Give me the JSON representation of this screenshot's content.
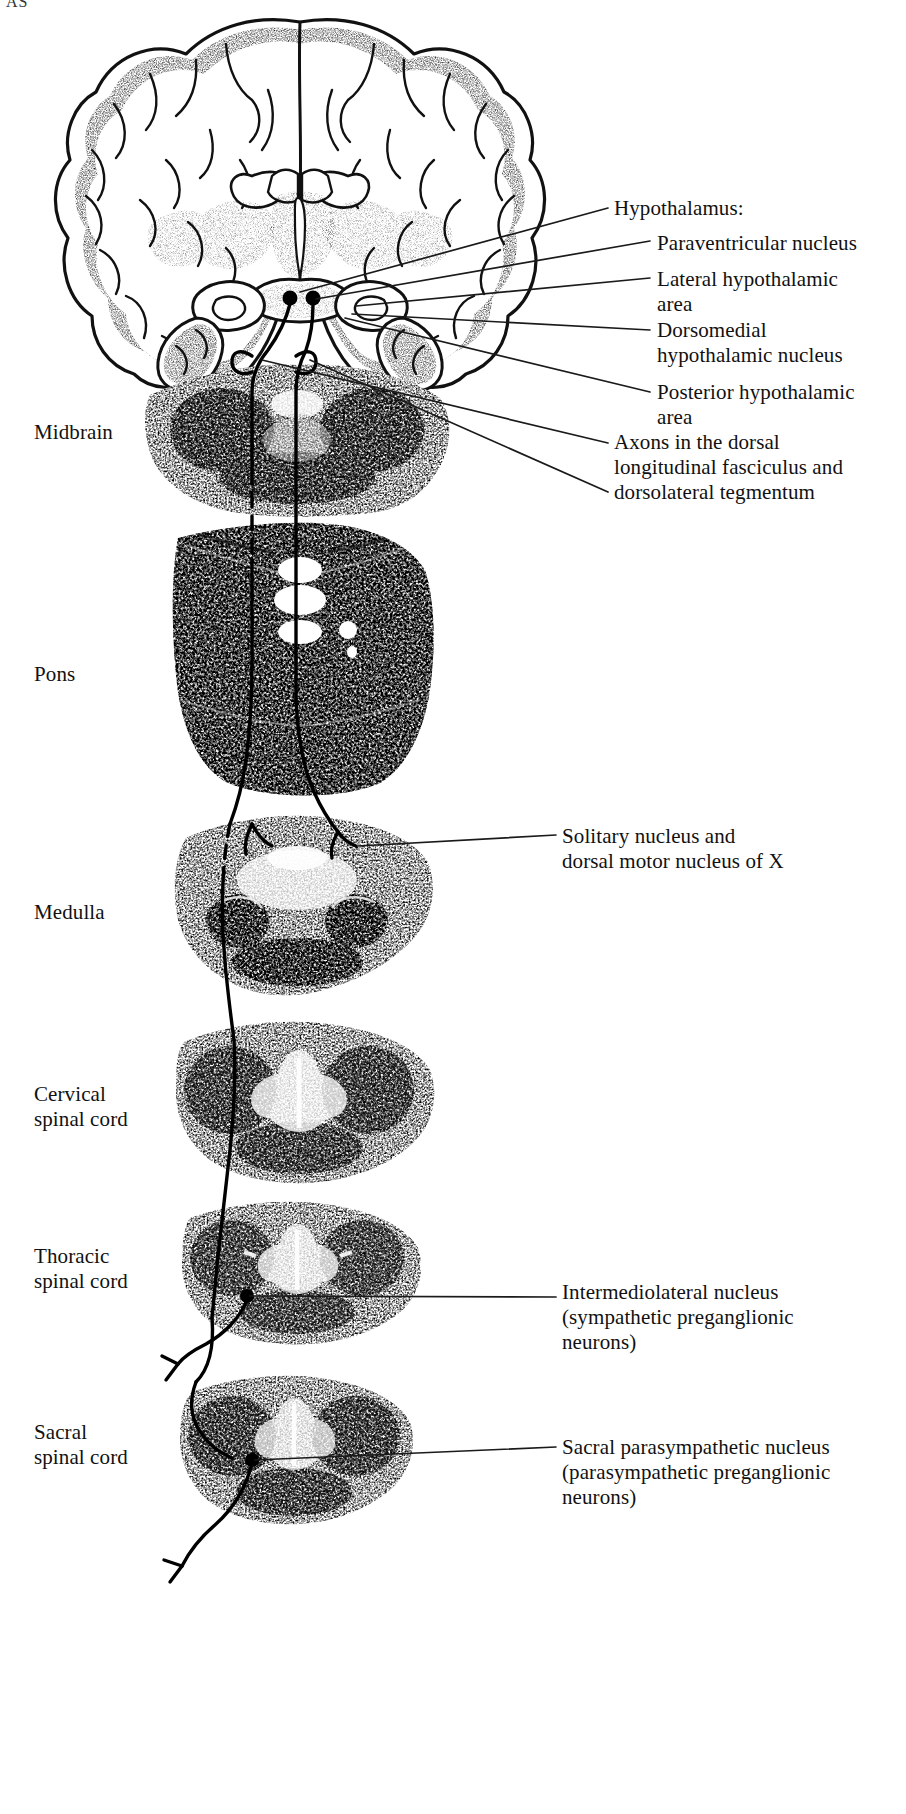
{
  "figure": {
    "corner_text": "AS",
    "title_alt": "Descending autonomic pathways from the hypothalamus to preganglionic neurons"
  },
  "right_labels": {
    "hypothalamus_heading": "Hypothalamus:",
    "paraventricular_nucleus": "Paraventricular nucleus",
    "lateral_hypothalamic_area": "Lateral hypothalamic\narea",
    "dorsomedial_hypothalamic_nucleus": "Dorsomedial\nhypothalamic nucleus",
    "posterior_hypothalamic_area": "Posterior hypothalamic\narea",
    "axons_dlf": "Axons in the dorsal\nlongitudinal fasciculus and\ndorsolateral tegmentum",
    "solitary_nucleus": "Solitary nucleus and\ndorsal motor nucleus of X",
    "intermediolateral_nucleus": "Intermediolateral nucleus\n(sympathetic preganglionic\nneurons)",
    "sacral_parasympathetic_nucleus": "Sacral parasympathetic nucleus\n(parasympathetic preganglionic\nneurons)"
  },
  "left_labels": {
    "midbrain": "Midbrain",
    "pons": "Pons",
    "medulla": "Medulla",
    "cervical_spinal_cord": "Cervical\nspinal cord",
    "thoracic_spinal_cord": "Thoracic\nspinal cord",
    "sacral_spinal_cord": "Sacral\nspinal cord"
  },
  "colors": {
    "ink": "#111111",
    "background": "#ffffff",
    "tissue_mid": "#8d8d8d",
    "tissue_dark": "#3a3a3a",
    "tissue_light": "#cfcfcf",
    "leader_line": "#1a1a1a"
  },
  "sections": [
    {
      "name": "coronal-forebrain",
      "label": "",
      "cy": 200
    },
    {
      "name": "midbrain",
      "label": "Midbrain",
      "cy": 460
    },
    {
      "name": "pons",
      "label": "Pons",
      "cy": 660
    },
    {
      "name": "medulla",
      "label": "Medulla",
      "cy": 930
    },
    {
      "name": "cervical-spinal-cord",
      "label": "Cervical spinal cord",
      "cy": 1110
    },
    {
      "name": "thoracic-spinal-cord",
      "label": "Thoracic spinal cord",
      "cy": 1290
    },
    {
      "name": "sacral-spinal-cord",
      "label": "Sacral spinal cord",
      "cy": 1470
    }
  ]
}
